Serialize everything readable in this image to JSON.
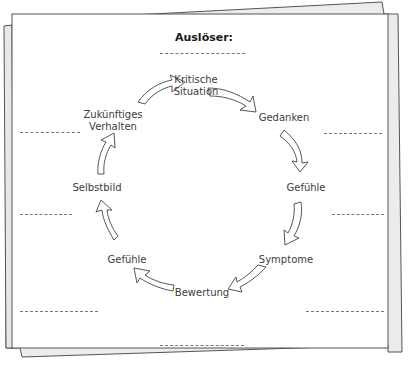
{
  "title": "Auslöser:",
  "nodes": [
    {
      "id": "kritische-situation",
      "label_line1": "Kritische",
      "label_line2": "Situation"
    },
    {
      "id": "gedanken",
      "label_line1": "Gedanken"
    },
    {
      "id": "gefuehle-right",
      "label_line1": "Gefühle"
    },
    {
      "id": "symptome",
      "label_line1": "Symptome"
    },
    {
      "id": "bewertung",
      "label_line1": "Bewertung"
    },
    {
      "id": "gefuehle-left",
      "label_line1": "Gefühle"
    },
    {
      "id": "selbstbild",
      "label_line1": "Selbstbild"
    },
    {
      "id": "zukuenftiges-verhalten",
      "label_line1": "Zukünftiges",
      "label_line2": "Verhalten"
    }
  ],
  "colors": {
    "paper": "#ffffff",
    "paper_shadow": "#eeeeee",
    "outline": "#555555",
    "text": "#3c3c3c",
    "dash": "#777777"
  }
}
